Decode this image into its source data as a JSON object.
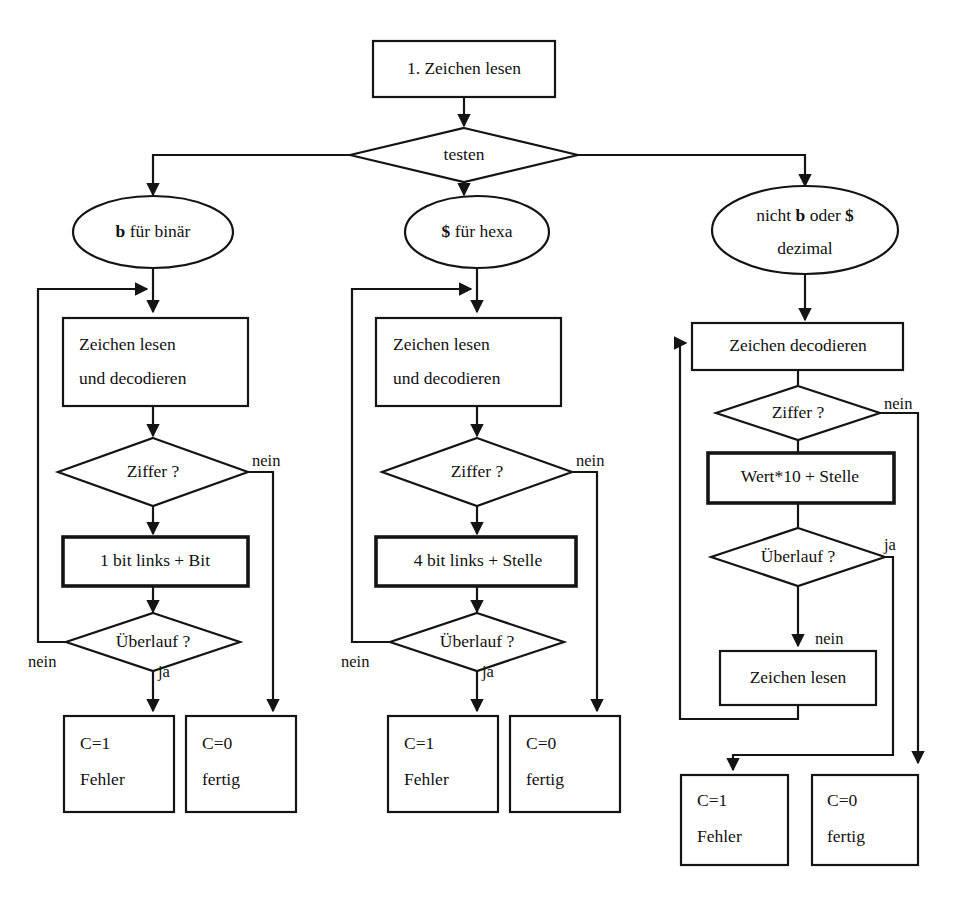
{
  "diagram": {
    "language": "de",
    "colors": {
      "background": "#ffffff",
      "stroke": "#141414",
      "text": "#111111"
    },
    "start": {
      "label": "1. Zeichen lesen"
    },
    "test": {
      "label": "testen"
    },
    "branches": {
      "binary": {
        "ellipse_line1_bold": "b",
        "ellipse_line1_rest": " für binär",
        "read_line1": "Zeichen lesen",
        "read_line2": "und decodieren",
        "digit_test": "Ziffer ?",
        "digit_no": "nein",
        "shift_op": "1 bit links + Bit",
        "overflow_test": "Überlauf ?",
        "overflow_no": "nein",
        "overflow_yes": "ja",
        "error_line1": "C=1",
        "error_line2": "Fehler",
        "done_line1": "C=0",
        "done_line2": "fertig"
      },
      "hexa": {
        "ellipse_line1_bold": "$",
        "ellipse_line1_rest": " für hexa",
        "read_line1": "Zeichen lesen",
        "read_line2": "und decodieren",
        "digit_test": "Ziffer ?",
        "digit_no": "nein",
        "shift_op": "4 bit links + Stelle",
        "overflow_test": "Überlauf ?",
        "overflow_no": "nein",
        "overflow_yes": "ja",
        "error_line1": "C=1",
        "error_line2": "Fehler",
        "done_line1": "C=0",
        "done_line2": "fertig"
      },
      "decimal": {
        "ellipse_l1_a": "nicht ",
        "ellipse_l1_b": "b",
        "ellipse_l1_c": " oder ",
        "ellipse_l1_d": "$",
        "ellipse_line2": "dezimal",
        "decode": "Zeichen decodieren",
        "digit_test": "Ziffer ?",
        "digit_no": "nein",
        "mul_op": "Wert*10 + Stelle",
        "overflow_test": "Überlauf ?",
        "overflow_yes": "ja",
        "overflow_no": "nein",
        "read": "Zeichen lesen",
        "error_line1": "C=1",
        "error_line2": "Fehler",
        "done_line1": "C=0",
        "done_line2": "fertig"
      }
    }
  }
}
